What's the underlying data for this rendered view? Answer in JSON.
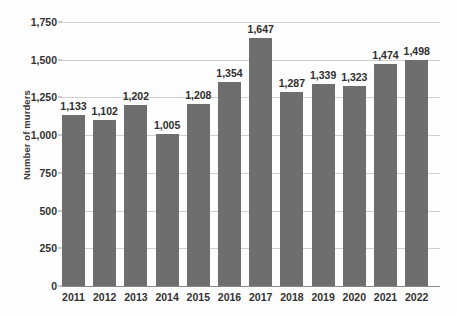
{
  "chart_data": {
    "type": "bar",
    "title": "",
    "subtitle": "",
    "xlabel": "",
    "ylabel": "Number of murders",
    "categories": [
      "2011",
      "2012",
      "2013",
      "2014",
      "2015",
      "2016",
      "2017",
      "2018",
      "2019",
      "2020",
      "2021",
      "2022"
    ],
    "values": [
      1133,
      1102,
      1202,
      1005,
      1208,
      1354,
      1647,
      1287,
      1339,
      1323,
      1474,
      1498
    ],
    "value_labels": [
      "1,133",
      "1,102",
      "1,202",
      "1,005",
      "1,208",
      "1,354",
      "1,647",
      "1,287",
      "1,339",
      "1,323",
      "1,474",
      "1,498"
    ],
    "ylim": [
      0,
      1750
    ],
    "yticks": [
      0,
      250,
      500,
      750,
      1000,
      1250,
      1500,
      1750
    ],
    "ytick_labels": [
      "0",
      "250",
      "500",
      "750",
      "1,000",
      "1,250",
      "1,500",
      "1,750"
    ],
    "grid": true,
    "legend": "none",
    "series": [
      {
        "name": "Number of murders",
        "color": "#6e6e6e",
        "values": [
          1133,
          1102,
          1202,
          1005,
          1208,
          1354,
          1647,
          1287,
          1339,
          1323,
          1474,
          1498
        ]
      }
    ],
    "colors": {
      "bar": "#6e6e6e",
      "gridline": "#cfcfcf",
      "axis": "#8a8a8a",
      "text": "#333333",
      "background": "#fdfdfd"
    }
  }
}
